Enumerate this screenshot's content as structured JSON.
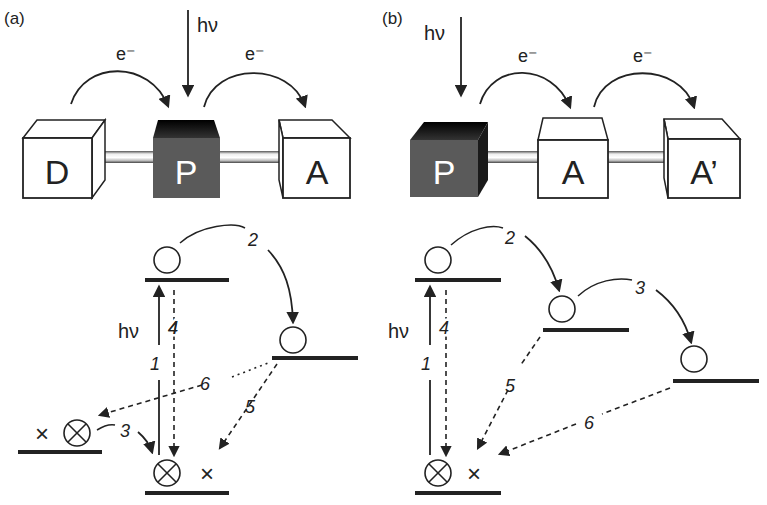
{
  "panels": {
    "a": {
      "label": "(a)",
      "top": {
        "light_label": "hν",
        "electron_labels": [
          "e⁻",
          "e⁻"
        ],
        "boxes": [
          {
            "id": "D",
            "label": "D",
            "style": "white-cube"
          },
          {
            "id": "P",
            "label": "P",
            "style": "dark-box"
          },
          {
            "id": "A",
            "label": "A",
            "style": "white-cube"
          }
        ]
      },
      "energy": {
        "light_label": "hν",
        "steps": [
          "1",
          "2",
          "3",
          "4",
          "5",
          "6"
        ],
        "ground_markers": {
          "occupied": "⊗",
          "hole": "×"
        }
      }
    },
    "b": {
      "label": "(b)",
      "top": {
        "light_label": "hν",
        "electron_labels": [
          "e⁻",
          "e⁻"
        ],
        "boxes": [
          {
            "id": "P",
            "label": "P",
            "style": "dark-cube"
          },
          {
            "id": "A",
            "label": "A",
            "style": "white-box"
          },
          {
            "id": "A2",
            "label": "A’",
            "style": "white-cube"
          }
        ]
      },
      "energy": {
        "light_label": "hν",
        "steps": [
          "1",
          "2",
          "3",
          "4",
          "5",
          "6"
        ],
        "ground_markers": {
          "occupied": "⊗",
          "hole": "×"
        }
      }
    }
  },
  "colors": {
    "ink": "#222222",
    "dark_box": "#5a5a5a",
    "dark_top": "#111111",
    "rod": "#d8d8d8",
    "background": "#ffffff"
  }
}
